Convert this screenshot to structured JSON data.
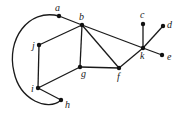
{
  "diagram": {
    "type": "graph",
    "nodes": [
      {
        "id": "a",
        "label": "a",
        "x": 59,
        "y": 16,
        "lx": 55,
        "ly": 11
      },
      {
        "id": "b",
        "label": "b",
        "x": 82,
        "y": 25,
        "lx": 79,
        "ly": 20
      },
      {
        "id": "c",
        "label": "c",
        "x": 143,
        "y": 24,
        "lx": 140,
        "ly": 18
      },
      {
        "id": "d",
        "label": "d",
        "x": 163,
        "y": 26,
        "lx": 167,
        "ly": 28
      },
      {
        "id": "e",
        "label": "e",
        "x": 162,
        "y": 55,
        "lx": 167,
        "ly": 60
      },
      {
        "id": "f",
        "label": "f",
        "x": 119,
        "y": 68,
        "lx": 117,
        "ly": 80
      },
      {
        "id": "g",
        "label": "g",
        "x": 80,
        "y": 67,
        "lx": 81,
        "ly": 77
      },
      {
        "id": "h",
        "label": "h",
        "x": 61,
        "y": 100,
        "lx": 65,
        "ly": 108
      },
      {
        "id": "i",
        "label": "i",
        "x": 38,
        "y": 88,
        "lx": 31,
        "ly": 92
      },
      {
        "id": "j",
        "label": "j",
        "x": 39,
        "y": 45,
        "lx": 32,
        "ly": 49
      },
      {
        "id": "k",
        "label": "k",
        "x": 143,
        "y": 48,
        "lx": 140,
        "ly": 59
      }
    ],
    "edges": [
      [
        "a",
        "b"
      ],
      [
        "b",
        "k"
      ],
      [
        "k",
        "e"
      ],
      [
        "b",
        "f"
      ],
      [
        "b",
        "g"
      ],
      [
        "b",
        "j"
      ],
      [
        "j",
        "i"
      ],
      [
        "i",
        "g"
      ],
      [
        "i",
        "h"
      ],
      [
        "g",
        "f"
      ],
      [
        "f",
        "k"
      ],
      [
        "k",
        "c"
      ],
      [
        "k",
        "d"
      ]
    ],
    "curved_edges": [
      {
        "from": "a",
        "to": "h",
        "path": "M59,16 C28,8 6,40 14,72 C20,100 48,112 61,100"
      }
    ]
  }
}
